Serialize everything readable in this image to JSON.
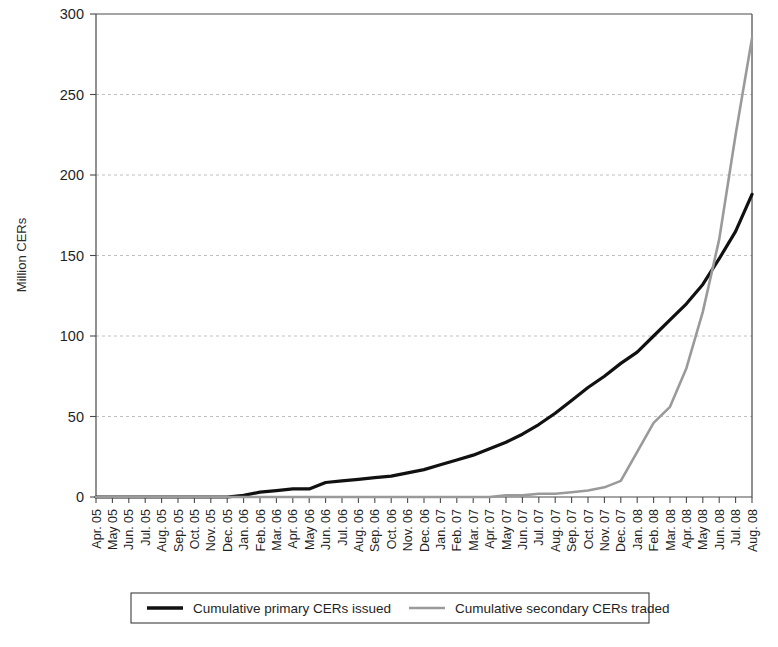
{
  "chart_data": {
    "type": "line",
    "title": "",
    "xlabel": "",
    "ylabel": "Million CERs",
    "ylim": [
      0,
      300
    ],
    "yticks": [
      0,
      50,
      100,
      150,
      200,
      250,
      300
    ],
    "grid": true,
    "legend_position": "bottom",
    "categories": [
      "Apr. 05",
      "May 05",
      "Jun. 05",
      "Jul. 05",
      "Aug. 05",
      "Sep. 05",
      "Oct. 05",
      "Nov. 05",
      "Dec. 05",
      "Jan. 06",
      "Feb. 06",
      "Mar. 06",
      "Apr. 06",
      "May 06",
      "Jun. 06",
      "Jul. 06",
      "Aug. 06",
      "Sep. 06",
      "Oct. 06",
      "Nov. 06",
      "Dec. 06",
      "Jan. 07",
      "Feb. 07",
      "Mar. 07",
      "Apr. 07",
      "May 07",
      "Jun. 07",
      "Jul. 07",
      "Aug. 07",
      "Sep. 07",
      "Oct. 07",
      "Nov. 07",
      "Dec. 07",
      "Jan. 08",
      "Feb. 08",
      "Mar. 08",
      "Apr. 08",
      "May 08",
      "Jun. 08",
      "Jul. 08",
      "Aug. 08"
    ],
    "series": [
      {
        "name": "Cumulative primary CERs issued",
        "color": "#111111",
        "values": [
          0,
          0,
          0,
          0,
          0,
          0,
          0,
          0,
          0,
          1,
          3,
          4,
          5,
          5,
          9,
          10,
          11,
          12,
          13,
          15,
          17,
          20,
          23,
          26,
          30,
          34,
          39,
          45,
          52,
          60,
          68,
          75,
          83,
          90,
          100,
          110,
          120,
          132,
          148,
          165,
          188
        ]
      },
      {
        "name": "Cumulative secondary CERs traded",
        "color": "#9a9a9a",
        "values": [
          0,
          0,
          0,
          0,
          0,
          0,
          0,
          0,
          0,
          0,
          0,
          0,
          0,
          0,
          0,
          0,
          0,
          0,
          0,
          0,
          0,
          0,
          0,
          0,
          0,
          1,
          1,
          2,
          2,
          3,
          4,
          6,
          10,
          28,
          46,
          56,
          80,
          115,
          160,
          225,
          285
        ]
      }
    ]
  },
  "legend": {
    "items": [
      {
        "label": "Cumulative primary CERs issued",
        "color": "#111111",
        "weight": 3.4
      },
      {
        "label": "Cumulative secondary CERs traded",
        "color": "#9a9a9a",
        "weight": 2.4
      }
    ]
  }
}
